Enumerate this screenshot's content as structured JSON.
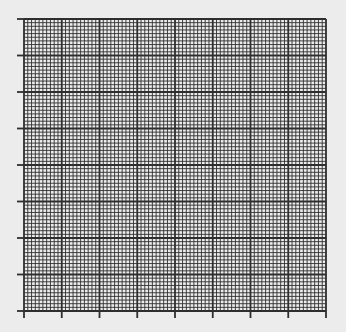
{
  "graph_paper": {
    "background_color": "#ececec",
    "line_color": "#2e2e2e",
    "origin": {
      "x": 24,
      "y": 19
    },
    "size": {
      "width": 302,
      "height": 292
    },
    "major_divisions": {
      "x": 8,
      "y": 8
    },
    "minor_per_major": 10,
    "tick_length": 7,
    "minor_line_width": 0.9,
    "major_line_width": 1.8
  }
}
